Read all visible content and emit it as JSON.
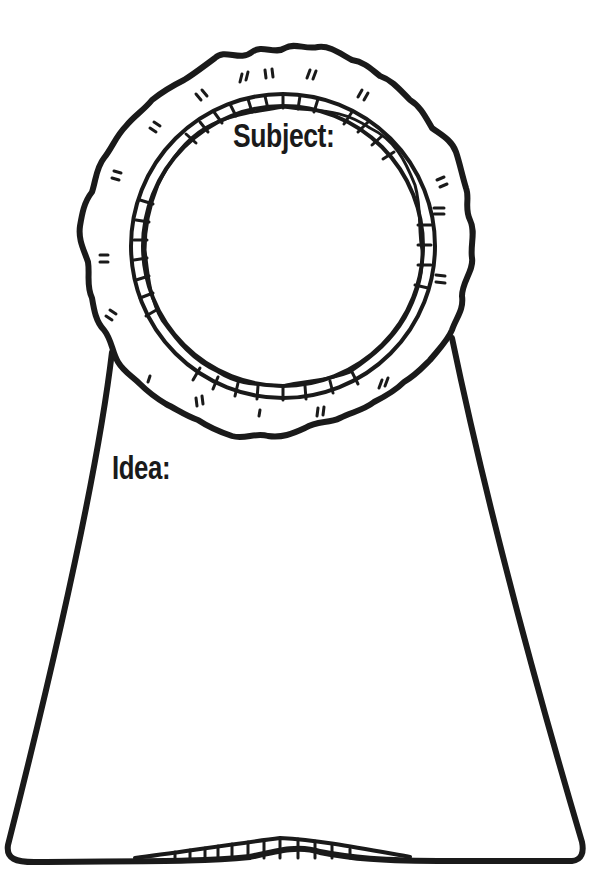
{
  "worksheet": {
    "type": "award ribbon graphic organizer",
    "subject_label": "Subject:",
    "idea_label": "Idea:",
    "subject_value": "",
    "idea_value": ""
  },
  "colors": {
    "ink": "#1a1a1a",
    "paper": "#ffffff"
  }
}
